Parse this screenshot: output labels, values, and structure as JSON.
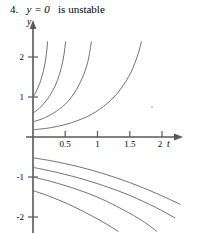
{
  "caption": {
    "number": "4.",
    "expression": "y = 0",
    "text": "is unstable",
    "full": "4.  y = 0 is unstable"
  },
  "axes": {
    "x_label": "t",
    "y_label": "y",
    "x_ticks": [
      {
        "value": 0.5,
        "label": "0.5"
      },
      {
        "value": 1.0,
        "label": "1"
      },
      {
        "value": 1.5,
        "label": "1.5"
      },
      {
        "value": 2.0,
        "label": "2"
      }
    ],
    "y_ticks": [
      {
        "value": 2,
        "label": "2"
      },
      {
        "value": 1,
        "label": "1"
      },
      {
        "value": -1,
        "label": "-1"
      },
      {
        "value": -2,
        "label": "-2"
      }
    ],
    "xlim": [
      0,
      2.28
    ],
    "ylim": [
      -2.4,
      2.45
    ],
    "origin_px": {
      "x": 33,
      "y": 123
    },
    "scale_px": {
      "x": 64.5,
      "y": 40
    },
    "axis_color": "#58585a"
  },
  "chart_data": {
    "type": "line",
    "xlabel": "t",
    "ylabel": "y",
    "xlim": [
      0,
      2.28
    ],
    "ylim": [
      -2.4,
      2.45
    ],
    "grid": false,
    "legend": null,
    "curve_color": "#6f7173",
    "equilibrium": {
      "y": 0,
      "stability": "unstable"
    },
    "series": [
      {
        "name": "upper-1",
        "initial_value": 1.0,
        "points": [
          [
            0.0,
            1.0
          ],
          [
            0.05,
            1.14
          ],
          [
            0.1,
            1.32
          ],
          [
            0.14,
            1.52
          ],
          [
            0.175,
            1.75
          ],
          [
            0.2,
            1.98
          ],
          [
            0.215,
            2.18
          ],
          [
            0.225,
            2.38
          ]
        ]
      },
      {
        "name": "upper-2",
        "initial_value": 0.6,
        "points": [
          [
            0.0,
            0.6
          ],
          [
            0.1,
            0.72
          ],
          [
            0.2,
            0.9
          ],
          [
            0.3,
            1.14
          ],
          [
            0.38,
            1.42
          ],
          [
            0.44,
            1.74
          ],
          [
            0.48,
            2.06
          ],
          [
            0.505,
            2.38
          ]
        ]
      },
      {
        "name": "upper-3",
        "initial_value": 0.38,
        "points": [
          [
            0.0,
            0.38
          ],
          [
            0.15,
            0.46
          ],
          [
            0.32,
            0.6
          ],
          [
            0.5,
            0.82
          ],
          [
            0.64,
            1.1
          ],
          [
            0.76,
            1.46
          ],
          [
            0.85,
            1.88
          ],
          [
            0.905,
            2.38
          ]
        ]
      },
      {
        "name": "upper-4",
        "initial_value": 0.18,
        "points": [
          [
            0.0,
            0.18
          ],
          [
            0.3,
            0.24
          ],
          [
            0.6,
            0.36
          ],
          [
            0.9,
            0.56
          ],
          [
            1.15,
            0.84
          ],
          [
            1.35,
            1.18
          ],
          [
            1.52,
            1.62
          ],
          [
            1.63,
            2.08
          ],
          [
            1.68,
            2.38
          ]
        ]
      },
      {
        "name": "lower-1",
        "initial_value": -0.52,
        "points": [
          [
            0.0,
            -0.52
          ],
          [
            0.3,
            -0.6
          ],
          [
            0.7,
            -0.74
          ],
          [
            1.1,
            -0.92
          ],
          [
            1.5,
            -1.14
          ],
          [
            1.9,
            -1.4
          ],
          [
            2.28,
            -1.68
          ]
        ]
      },
      {
        "name": "lower-2",
        "initial_value": -0.76,
        "points": [
          [
            0.0,
            -0.76
          ],
          [
            0.3,
            -0.86
          ],
          [
            0.7,
            -1.02
          ],
          [
            1.1,
            -1.22
          ],
          [
            1.5,
            -1.46
          ],
          [
            1.9,
            -1.76
          ],
          [
            2.2,
            -2.02
          ]
        ]
      },
      {
        "name": "lower-3",
        "initial_value": -1.0,
        "points": [
          [
            0.0,
            -1.0
          ],
          [
            0.3,
            -1.12
          ],
          [
            0.7,
            -1.32
          ],
          [
            1.05,
            -1.54
          ],
          [
            1.4,
            -1.82
          ],
          [
            1.7,
            -2.1
          ],
          [
            1.92,
            -2.36
          ]
        ]
      },
      {
        "name": "lower-4",
        "initial_value": -1.34,
        "points": [
          [
            0.0,
            -1.34
          ],
          [
            0.25,
            -1.48
          ],
          [
            0.55,
            -1.68
          ],
          [
            0.85,
            -1.92
          ],
          [
            1.1,
            -2.14
          ],
          [
            1.32,
            -2.36
          ]
        ]
      }
    ]
  }
}
